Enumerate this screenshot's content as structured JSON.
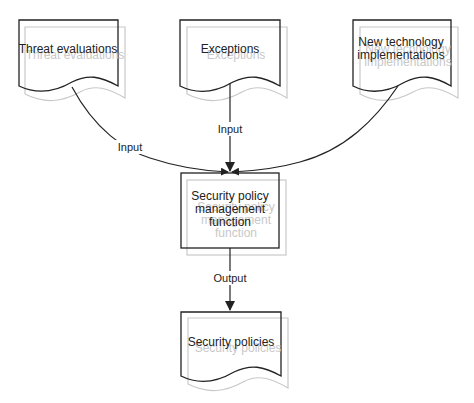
{
  "diagram": {
    "type": "flowchart",
    "nodes": {
      "threat": {
        "shape": "document",
        "lines": [
          "Threat evaluations"
        ]
      },
      "exceptions": {
        "shape": "document",
        "lines": [
          "Exceptions"
        ]
      },
      "newtech": {
        "shape": "document",
        "lines": [
          "New technology",
          "implementations"
        ]
      },
      "function": {
        "shape": "process",
        "lines": [
          "Security policy",
          "management",
          "function"
        ]
      },
      "policies": {
        "shape": "document",
        "lines": [
          "Security policies"
        ]
      }
    },
    "edges": {
      "threat_to_function": {
        "from": "Threat evaluations",
        "to": "Security policy management function",
        "label": "Input"
      },
      "exceptions_to_function": {
        "from": "Exceptions",
        "to": "Security policy management function",
        "label": "Input"
      },
      "newtech_to_function": {
        "from": "New technology implementations",
        "to": "Security policy management function",
        "label": ""
      },
      "function_to_policies": {
        "from": "Security policy management function",
        "to": "Security policies",
        "label": "Output"
      }
    },
    "colors": {
      "stroke": "#222222",
      "shadow": "#c8c8c8",
      "background": "#ffffff"
    }
  }
}
